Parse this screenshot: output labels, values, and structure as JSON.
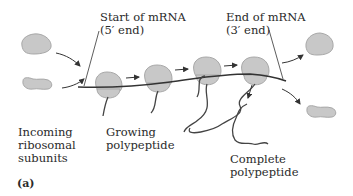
{
  "figure": {
    "panel_label": "(a)",
    "labels": {
      "start_mrna": {
        "line1": "Start of mRNA",
        "line2": "(5′ end)"
      },
      "end_mrna": {
        "line1": "End of mRNA",
        "line2": "(3′ end)"
      },
      "incoming": {
        "line1": "Incoming",
        "line2": "ribosomal",
        "line3": "subunits"
      },
      "growing": {
        "line1": "Growing",
        "line2": "polypeptide"
      },
      "complete": {
        "line1": "Complete",
        "line2": "polypeptide"
      }
    },
    "colors": {
      "ribosome_fill": "#c8c8c8",
      "ribosome_stroke": "#a8a8a8",
      "line": "#333333",
      "text": "#2a2a2a"
    },
    "elements": [
      "incoming-large-subunit",
      "incoming-small-subunit",
      "mrna-strand",
      "ribosome-1",
      "ribosome-2",
      "ribosome-3",
      "ribosome-4",
      "outgoing-large-subunit",
      "outgoing-small-subunit",
      "growing-polypeptide-chains",
      "complete-polypeptide"
    ]
  }
}
